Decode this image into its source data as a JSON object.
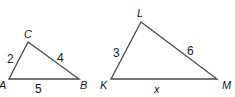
{
  "triangles": [
    {
      "name": "ABC",
      "vertices": {
        "A": "A",
        "B": "B",
        "C": "C"
      },
      "sides": {
        "AC": "2",
        "CB": "4",
        "AB": "5"
      }
    },
    {
      "name": "KLM",
      "vertices": {
        "K": "K",
        "L": "L",
        "M": "M"
      },
      "sides": {
        "KL": "3",
        "LM": "6",
        "KM": "x"
      }
    }
  ],
  "colors": {
    "stroke": "#4a4a4a",
    "text": "#1a1a1a",
    "background": "#ffffff"
  }
}
